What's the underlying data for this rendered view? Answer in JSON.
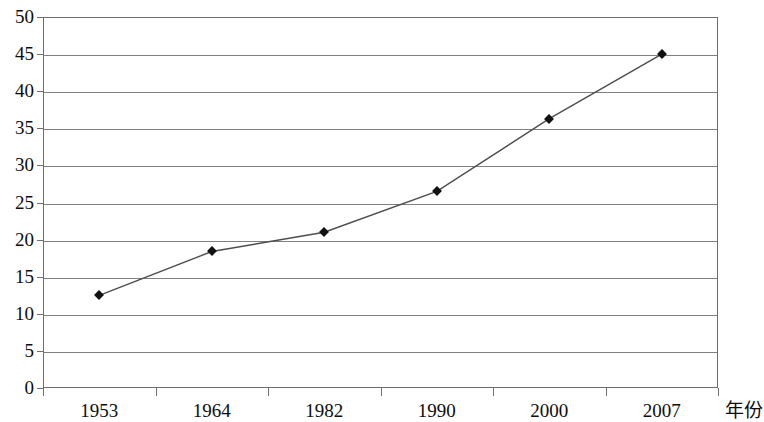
{
  "chart_data": {
    "type": "line",
    "title": "",
    "subtitle": "",
    "xlabel": "年份",
    "ylabel": "",
    "categories": [
      "1953",
      "1964",
      "1982",
      "1990",
      "2000",
      "2007"
    ],
    "values": [
      12.5,
      18.4,
      21.0,
      26.5,
      36.3,
      45.0
    ],
    "series": [
      {
        "name": "",
        "values": [
          12.5,
          18.4,
          21.0,
          26.5,
          36.3,
          45.0
        ]
      }
    ],
    "ylim": [
      0,
      50
    ],
    "ytick_labels": [
      "0",
      "5",
      "10",
      "15",
      "20",
      "25",
      "30",
      "35",
      "40",
      "45",
      "50"
    ],
    "ytick_values": [
      0,
      5,
      10,
      15,
      20,
      25,
      30,
      35,
      40,
      45,
      50
    ],
    "grid": "horizontal",
    "legend": "none",
    "marker": "diamond",
    "line_color": "#4d4d4d",
    "marker_color": "#111111",
    "grid_color": "#808080",
    "axis_color": "#6e6e6e",
    "background": "#ffffff"
  }
}
